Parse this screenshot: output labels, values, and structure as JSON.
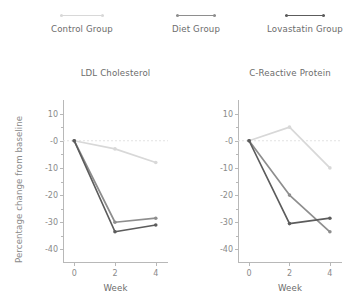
{
  "legend": {
    "entries": [
      {
        "label": "Control Group",
        "color": "#d8d8d8",
        "center_x": 82,
        "swatch_width": 44
      },
      {
        "label": "Diet Group",
        "color": "#8e8e8e",
        "center_x": 196,
        "swatch_width": 40
      },
      {
        "label": "Lovastatin Group",
        "color": "#5c5c5c",
        "center_x": 305,
        "swatch_width": 40
      }
    ]
  },
  "axis": {
    "ylabel": "Percentage change from baseline",
    "xlabel": "Week",
    "yticks": [
      "10",
      "-0",
      "-10",
      "-20",
      "-30",
      "-40"
    ],
    "ytick_values": [
      10,
      0,
      -10,
      -20,
      -30,
      -40
    ],
    "xticks": [
      "0",
      "2",
      "4"
    ],
    "xtick_values": [
      0,
      2,
      4
    ],
    "ylim": [
      -45,
      15
    ],
    "xlim": [
      -0.55,
      4.6
    ],
    "zero_line_color": "#e2e2e2"
  },
  "chart_data": [
    {
      "type": "line",
      "title": "LDL Cholesterol",
      "xlabel": "Week",
      "ylabel": "Percentage change from baseline",
      "x": [
        0,
        2,
        4
      ],
      "xlim": [
        -0.55,
        4.6
      ],
      "ylim": [
        -45,
        15
      ],
      "yticks": [
        10,
        0,
        -10,
        -20,
        -30,
        -40
      ],
      "grid": false,
      "legend_position": "above-figure",
      "series": [
        {
          "name": "Control Group",
          "color": "#d8d8d8",
          "values": [
            0,
            -3.0,
            -8.0
          ]
        },
        {
          "name": "Diet Group",
          "color": "#8e8e8e",
          "values": [
            0,
            -30.0,
            -28.5
          ]
        },
        {
          "name": "Lovastatin Group",
          "color": "#5c5c5c",
          "values": [
            0,
            -33.5,
            -31.0
          ]
        }
      ]
    },
    {
      "type": "line",
      "title": "C-Reactive Protein",
      "xlabel": "Week",
      "ylabel": "Percentage change from baseline",
      "x": [
        0,
        2,
        4
      ],
      "xlim": [
        -0.55,
        4.6
      ],
      "ylim": [
        -45,
        15
      ],
      "yticks": [
        10,
        0,
        -10,
        -20,
        -30,
        -40
      ],
      "grid": false,
      "legend_position": "above-figure",
      "series": [
        {
          "name": "Control Group",
          "color": "#d8d8d8",
          "values": [
            0,
            5.0,
            -10.0
          ]
        },
        {
          "name": "Diet Group",
          "color": "#8e8e8e",
          "values": [
            0,
            -20.0,
            -33.5
          ]
        },
        {
          "name": "Lovastatin Group",
          "color": "#5c5c5c",
          "values": [
            0,
            -30.5,
            -28.5
          ]
        }
      ]
    }
  ]
}
